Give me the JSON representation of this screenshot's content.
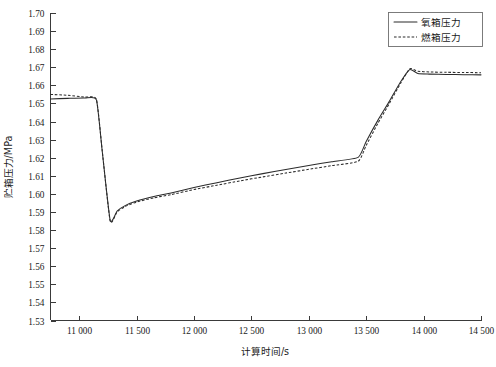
{
  "chart_data": {
    "type": "line",
    "title": "",
    "xlabel": "计算时间/s",
    "ylabel": "贮箱压力/MPa",
    "xlim": [
      10750,
      14500
    ],
    "ylim": [
      1.53,
      1.7
    ],
    "grid": false,
    "legend_position": "top-right",
    "xticks": [
      11000,
      11500,
      12000,
      12500,
      13000,
      13500,
      14000,
      14500
    ],
    "xticklabels": [
      "11 000",
      "11 500",
      "12 000",
      "12 500",
      "13 000",
      "13 500",
      "14 000",
      "14 500"
    ],
    "yticks": [
      1.53,
      1.54,
      1.55,
      1.56,
      1.57,
      1.58,
      1.59,
      1.6,
      1.61,
      1.62,
      1.63,
      1.64,
      1.65,
      1.66,
      1.67,
      1.68,
      1.69,
      1.7
    ],
    "yticklabels": [
      "1.53",
      "1.54",
      "1.55",
      "1.56",
      "1.57",
      "1.58",
      "1.59",
      "1.60",
      "1.61",
      "1.62",
      "1.63",
      "1.64",
      "1.65",
      "1.66",
      "1.67",
      "1.68",
      "1.69",
      "1.70"
    ],
    "series": [
      {
        "name": "氧箱压力",
        "style": "solid",
        "color": "#2b2b2b",
        "x": [
          10750,
          10900,
          11050,
          11150,
          11200,
          11270,
          11330,
          11400,
          11500,
          11650,
          11800,
          12000,
          12200,
          12400,
          12600,
          12800,
          13000,
          13200,
          13430,
          13500,
          13600,
          13700,
          13800,
          13880,
          13950,
          14050,
          14200,
          14350,
          14500
        ],
        "y": [
          1.6525,
          1.6528,
          1.653,
          1.652,
          1.624,
          1.5853,
          1.5905,
          1.5935,
          1.596,
          1.5985,
          1.6005,
          1.6035,
          1.6062,
          1.6088,
          1.6112,
          1.6135,
          1.6157,
          1.6178,
          1.6202,
          1.629,
          1.6405,
          1.651,
          1.662,
          1.6688,
          1.6665,
          1.6662,
          1.666,
          1.6659,
          1.6658
        ]
      },
      {
        "name": "燃箱压力",
        "style": "dashed",
        "color": "#2b2b2b",
        "x": [
          10750,
          10900,
          11050,
          11150,
          11200,
          11270,
          11330,
          11400,
          11500,
          11650,
          11800,
          12000,
          12200,
          12400,
          12600,
          12800,
          13000,
          13200,
          13430,
          13500,
          13600,
          13700,
          13800,
          13880,
          13950,
          14050,
          14200,
          14350,
          14500
        ],
        "y": [
          1.655,
          1.6545,
          1.6535,
          1.6522,
          1.6242,
          1.5848,
          1.59,
          1.593,
          1.5955,
          1.5978,
          1.5996,
          1.6024,
          1.6048,
          1.6072,
          1.6094,
          1.6115,
          1.6136,
          1.6156,
          1.618,
          1.6268,
          1.6388,
          1.6498,
          1.6612,
          1.6692,
          1.6678,
          1.6674,
          1.6672,
          1.6671,
          1.667
        ]
      }
    ]
  },
  "legend": {
    "items": [
      {
        "label": "氧箱压力",
        "style": "solid"
      },
      {
        "label": "燃箱压力",
        "style": "dashed"
      }
    ]
  }
}
